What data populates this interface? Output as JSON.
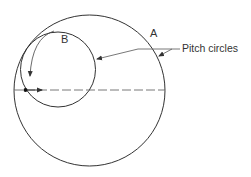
{
  "diagram": {
    "type": "gear pitch circles",
    "labels": {
      "gear_a": "A",
      "gear_b": "B",
      "pitch_circles": "Pitch circles"
    },
    "circles": [
      {
        "id": "A",
        "cx": 89.5,
        "cy": 90.5,
        "r": 75.5
      },
      {
        "id": "B",
        "cx": 58,
        "cy": 69.5,
        "r": 37.5
      }
    ],
    "colors": {
      "stroke": "#333333",
      "background": "#ffffff"
    }
  }
}
